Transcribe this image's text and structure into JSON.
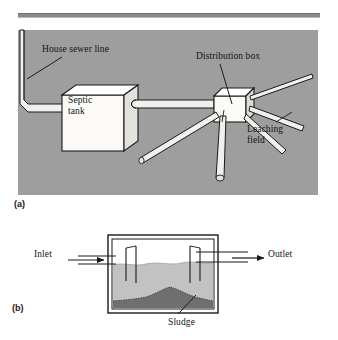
{
  "figure": {
    "title": "",
    "divider": "horizontal-rule",
    "panels": [
      {
        "key": "a",
        "tag": "(a)",
        "caption": "Septic system plan view",
        "background_color": "#9e9e9e",
        "labels": [
          {
            "id": "house_sewer_line",
            "text": "House sewer line"
          },
          {
            "id": "distribution_box",
            "text": "Distribution box"
          },
          {
            "id": "septic_tank",
            "text": "Septic\ntank",
            "line1": "Septic",
            "line2": "tank"
          },
          {
            "id": "leaching_field",
            "text": "Leaching\nfield",
            "line1": "Leaching",
            "line2": "field"
          }
        ]
      },
      {
        "key": "b",
        "tag": "(b)",
        "caption": "Septic tank cross-section",
        "background_color": "#ffffff",
        "labels": [
          {
            "id": "inlet",
            "text": "Inlet"
          },
          {
            "id": "outlet",
            "text": "Outlet"
          },
          {
            "id": "sludge",
            "text": "Sludge"
          }
        ]
      }
    ],
    "colors": {
      "panel_gray": "#9e9e9e",
      "pipe_fill": "#f2f0ec",
      "outline": "#1a1a1a",
      "liquid_fill": "#bdbdbd",
      "sludge_fill": "#777777",
      "rule_gray": "#8a8a8a"
    }
  }
}
